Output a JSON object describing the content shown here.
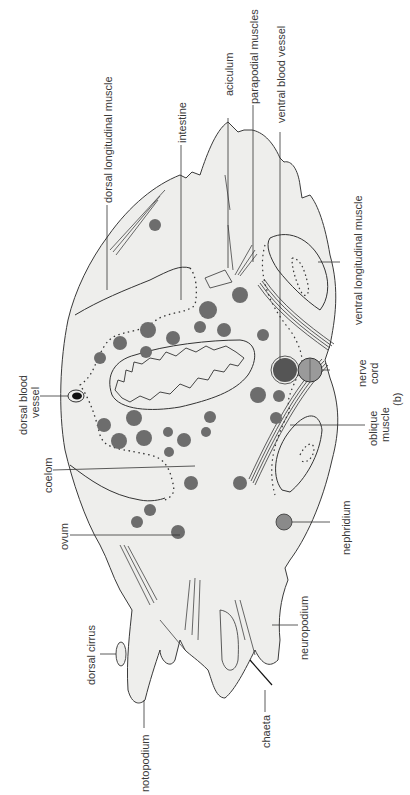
{
  "figure": {
    "panel_label": "(b)",
    "colors": {
      "background": "#ffffff",
      "body_fill": "#eeeeec",
      "outline": "#3a3a3a",
      "ovum": "#6d6d6d",
      "label_text": "#3a3a3a"
    }
  },
  "labels": {
    "dorsal_longitudinal_muscle": "dorsal longitudinal muscle",
    "intestine": "intestine",
    "aciculum": "aciculum",
    "parapodial_muscles": "parapodial muscles",
    "ventral_blood_vessel": "ventral blood vessel",
    "ventral_longitudinal_muscle": "ventral longitudinal muscle",
    "dorsal_blood_vessel_1": "dorsal blood",
    "dorsal_blood_vessel_2": "vessel",
    "nerve_cord_1": "nerve",
    "nerve_cord_2": "cord",
    "oblique_muscle_1": "oblique",
    "oblique_muscle_2": "muscle",
    "coelom": "coelom",
    "nephridium": "nephridium",
    "ovum": "ovum",
    "dorsal_cirrus": "dorsal cirrus",
    "neuropodium": "neuropodium",
    "chaeta": "chaeta",
    "notopodium": "notopodium"
  }
}
